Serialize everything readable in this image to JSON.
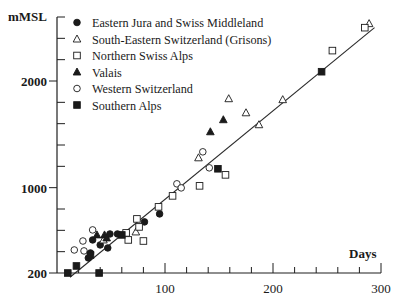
{
  "chart_data": {
    "type": "scatter",
    "title": "",
    "xlabel": "Days",
    "ylabel": "mMSL",
    "xlim": [
      0,
      300
    ],
    "ylim": [
      200,
      2600
    ],
    "x_ticks_major": [
      100,
      200,
      300
    ],
    "x_tick_labels": [
      "100",
      "200",
      "300"
    ],
    "x_minor_step": 20,
    "y_ticks_major": [
      200,
      1000,
      2000
    ],
    "y_tick_labels": [
      "200",
      "1000",
      "2000"
    ],
    "y_minor_step": 200,
    "grid": false,
    "legend_position": "top-left",
    "regression_line": {
      "x": [
        12,
        294
      ],
      "y": [
        160,
        2500
      ]
    },
    "series": [
      {
        "name": "Eastern Jura and Swiss Middleland",
        "marker": "filled-circle",
        "points": [
          [
            29,
            341
          ],
          [
            31,
            388
          ],
          [
            33,
            510
          ],
          [
            40,
            463
          ],
          [
            45,
            529
          ],
          [
            47,
            435
          ],
          [
            49,
            566
          ],
          [
            56,
            566
          ],
          [
            81,
            679
          ],
          [
            95,
            754
          ]
        ]
      },
      {
        "name": "South-Eastern Switzerland (Grisons)",
        "marker": "open-triangle",
        "points": [
          [
            43,
            510
          ],
          [
            73,
            585
          ],
          [
            131,
            1280
          ],
          [
            159,
            1834
          ],
          [
            175,
            1702
          ],
          [
            187,
            1590
          ],
          [
            209,
            1825
          ],
          [
            289,
            2538
          ]
        ]
      },
      {
        "name": "Northern Swiss Alps",
        "marker": "open-square",
        "points": [
          [
            64,
            576
          ],
          [
            66,
            510
          ],
          [
            74,
            707
          ],
          [
            76,
            632
          ],
          [
            80,
            500
          ],
          [
            94,
            820
          ],
          [
            107,
            923
          ],
          [
            132,
            1017
          ],
          [
            156,
            1120
          ],
          [
            255,
            2285
          ],
          [
            285,
            2500
          ]
        ]
      },
      {
        "name": "Valais",
        "marker": "filled-triangle",
        "points": [
          [
            37,
            557
          ],
          [
            44,
            557
          ],
          [
            46,
            529
          ],
          [
            142,
            1524
          ],
          [
            154,
            1637
          ]
        ]
      },
      {
        "name": "Western Switzerland",
        "marker": "open-circle",
        "points": [
          [
            16,
            416
          ],
          [
            24,
            500
          ],
          [
            25,
            407
          ],
          [
            33,
            604
          ],
          [
            111,
            1036
          ],
          [
            115,
            998
          ],
          [
            135,
            1336
          ],
          [
            141,
            1186
          ]
        ]
      },
      {
        "name": "Southern Alps",
        "marker": "filled-square",
        "points": [
          [
            10,
            200
          ],
          [
            18,
            266
          ],
          [
            31,
            369
          ],
          [
            39,
            200
          ],
          [
            60,
            557
          ],
          [
            149,
            1177
          ],
          [
            245,
            2087
          ]
        ]
      }
    ]
  }
}
